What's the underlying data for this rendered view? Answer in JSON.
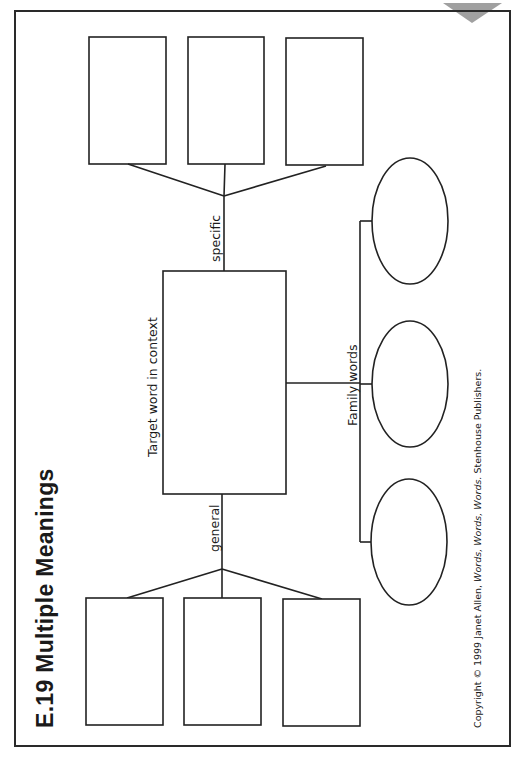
{
  "page": {
    "title": "E.19  Multiple Meanings",
    "corner_marker": "triangle-tab",
    "colors": {
      "line": "#222222",
      "background": "#ffffff",
      "corner_marker": "#a0a0a0"
    }
  },
  "diagram": {
    "center": {
      "label": "Target word in context"
    },
    "branches": {
      "specific": {
        "label": "specific",
        "boxes": 3
      },
      "general": {
        "label": "general",
        "boxes": 3
      },
      "family": {
        "label": "Family words",
        "ovals": 3
      }
    }
  },
  "footer": {
    "copyright_prefix": "Copyright © 1999 Janet Allen, ",
    "copyright_title": "Words, Words, Words.",
    "copyright_suffix": " Stenhouse Publishers."
  }
}
